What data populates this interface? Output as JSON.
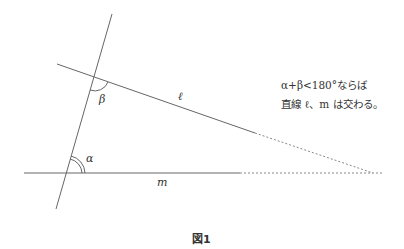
{
  "figure": {
    "caption": "図1",
    "labels": {
      "alpha": "α",
      "beta": "β",
      "line_l": "ℓ",
      "line_m": "m"
    },
    "note": {
      "line1": "α+β<180°ならば",
      "line2": "直線 ℓ、m は交わる。"
    },
    "colors": {
      "line": "#666666",
      "text": "#333333"
    }
  }
}
